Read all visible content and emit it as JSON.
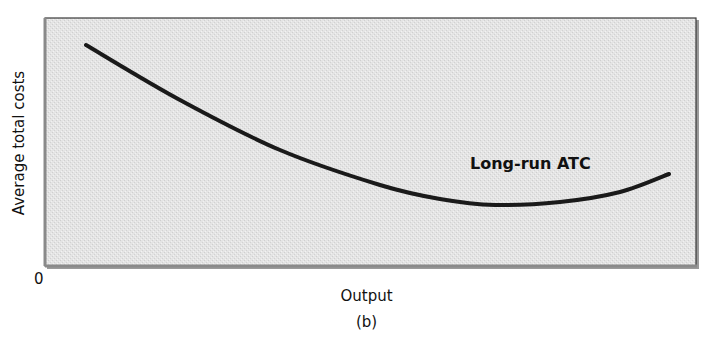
{
  "chart_data": {
    "type": "line",
    "title": "",
    "subtitle": "(b)",
    "xlabel": "Output",
    "ylabel": "Average total costs",
    "origin_label": "0",
    "x_ticks": [],
    "y_ticks": [],
    "grid": false,
    "legend": null,
    "series": [
      {
        "name": "Long-run ATC",
        "shape": "U-shaped (decreasing then slightly increasing)",
        "points_px": [
          [
            86,
            45
          ],
          [
            180,
            100
          ],
          [
            280,
            150
          ],
          [
            380,
            185
          ],
          [
            440,
            199
          ],
          [
            495,
            205
          ],
          [
            560,
            202
          ],
          [
            620,
            192
          ],
          [
            669,
            174
          ]
        ]
      }
    ],
    "annotations": [
      {
        "text": "Long-run ATC",
        "x_px": 470,
        "y_px": 165
      }
    ],
    "plot_area": {
      "background": "#e6e6e6",
      "border": "#333333"
    }
  },
  "labels": {
    "ylabel": "Average total costs",
    "origin": "0",
    "xlabel": "Output",
    "caption": "(b)",
    "curve": "Long-run ATC"
  }
}
